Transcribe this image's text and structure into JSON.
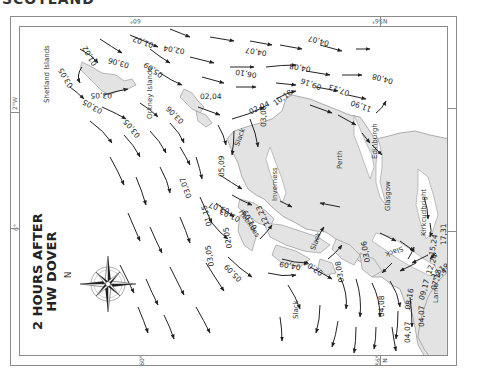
{
  "header": {
    "title": "SCOTLAND"
  },
  "chart": {
    "title_line1": "2 HOURS AFTER",
    "title_line2": "HW DOVER",
    "compass": {
      "north_label": "N",
      "icon": "compass-rose-icon"
    }
  },
  "frame": {
    "top_labels": [
      "60°",
      "56°",
      "N"
    ],
    "bottom_labels": [
      "60°",
      "56°",
      "N"
    ],
    "left_labels": [
      "2°W",
      "6°"
    ],
    "right_labels": [
      "2°W",
      "6°"
    ]
  },
  "places": {
    "shetland": "Shetland Islands",
    "orkney": "Orkney Islands",
    "inverness": "Inverness",
    "perth": "Perth",
    "edinburgh": "Edinburgh",
    "glasgow": "Glasgow",
    "kirkcudbright": "Kirkcudbright",
    "larne": "Larne",
    "hebrides": "Hebrides",
    "slack1": "Slack",
    "slack2": "Slack",
    "slack3": "Slack",
    "slack4": "Slack"
  },
  "rates": {
    "r01": "01,02",
    "r02": "03,05",
    "r03": "02,04",
    "r04": "04,07",
    "r05": "03,06",
    "r06": "05,09",
    "r07": "01,02",
    "r08": "04,07",
    "r09": "06,10",
    "r10": "04,08",
    "r11": "03,05",
    "r12": "03,05",
    "r13": "03,05",
    "r14": "02,04",
    "r15": "03,06",
    "r16": "02,04",
    "r17": "10,18",
    "r18": "09,16",
    "r19": "07,13",
    "r20": "04,08",
    "r21": "11,90",
    "r22": "03,06",
    "r23": "05,09",
    "r24": "03,07",
    "r25": "03,07",
    "r26": "01,03",
    "r27": "01,15",
    "r28": "03,05",
    "r29": "02,05",
    "r30": "12,23",
    "r31": "05,09",
    "r32": "01,09",
    "r33": "04,09",
    "r34": "02,04",
    "r35": "03,08",
    "r36": "03,06",
    "r37": "04,08",
    "r38": "08,16",
    "r39": "09,17",
    "r40": "07,13",
    "r41": "12,24",
    "r42": "15,24",
    "r43": "29,42",
    "r44": "19,27",
    "r45": "17,31",
    "r46": "04,07",
    "r47": "04,07",
    "r48": "04,05"
  },
  "colors": {
    "land": "#e3e3e3",
    "coast": "#9a9a9a",
    "arrow": "#222222",
    "frame": "#8a8a8a"
  }
}
